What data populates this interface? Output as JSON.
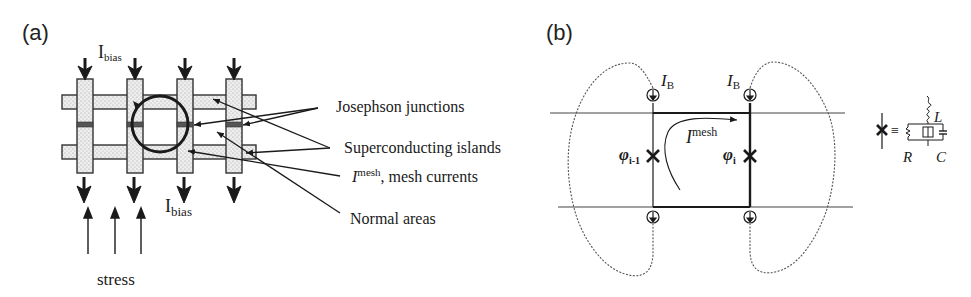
{
  "panel_a": {
    "label": "(a)",
    "bias_top_main": "I",
    "bias_top_sub": "bias",
    "bias_bottom_main": "I",
    "bias_bottom_sub": "bias",
    "annotations": {
      "josephson": "Josephson junctions",
      "islands": "Superconducting islands",
      "mesh_main": "I",
      "mesh_sup": "mesh",
      "mesh_rest": ", mesh currents",
      "normal": "Normal areas"
    },
    "stress_label": "stress"
  },
  "panel_b": {
    "label": "(b)",
    "source_left_main": "I",
    "source_left_sub": "B",
    "source_right_main": "I",
    "source_right_sub": "B",
    "mesh_main": "I",
    "mesh_sup": "mesh",
    "phi_left_main": "φ",
    "phi_left_sub": "i-1",
    "phi_right_main": "φ",
    "phi_right_sub": "i",
    "equivalent": {
      "equals": "≡",
      "L": "L",
      "R": "R",
      "C": "C"
    }
  },
  "colors": {
    "ink": "#1a1a1a",
    "stipple_fill": "#e6e6e6",
    "junction": "#555555"
  }
}
